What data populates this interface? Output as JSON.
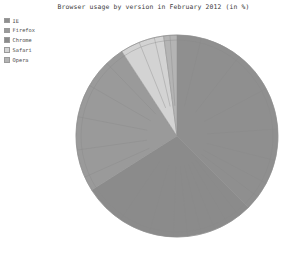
{
  "chart_data": {
    "type": "pie",
    "title": "Browser usage by version in February 2012 (in %)",
    "xlabel": "",
    "ylabel": "",
    "legend_position": "top-left",
    "grid": false,
    "start_angle_deg": 90,
    "direction": "clockwise",
    "categories": [
      "IE",
      "Firefox",
      "Chrome",
      "Safari",
      "Opera"
    ],
    "values": [
      37.5,
      24.8,
      28.5,
      7.1,
      2.1
    ],
    "colors": [
      "#8f8f8f",
      "#9a9a9a",
      "#8b8b8b",
      "#d3d3d3",
      "#b4b4b4"
    ],
    "series": [
      {
        "name": "Browser usage",
        "values": [
          37.5,
          24.8,
          28.5,
          7.1,
          2.1
        ]
      }
    ],
    "slices": [
      {
        "label": "IE",
        "value": 37.5,
        "color": "#8f8f8f",
        "start_deg": 0,
        "end_deg": 135,
        "version_divisions": [
          14,
          38,
          62,
          86,
          104,
          118,
          127
        ]
      },
      {
        "label": "Chrome",
        "value": 28.5,
        "color": "#8b8b8b",
        "start_deg": 135,
        "end_deg": 237.6,
        "version_divisions": [
          142,
          150,
          158,
          166,
          174,
          182,
          196,
          214
        ]
      },
      {
        "label": "Firefox",
        "value": 24.8,
        "color": "#9a9a9a",
        "start_deg": 237.6,
        "end_deg": 326.9,
        "version_divisions": [
          246,
          262,
          281,
          300,
          316
        ]
      },
      {
        "label": "Safari",
        "value": 7.1,
        "color": "#d3d3d3",
        "start_deg": 326.9,
        "end_deg": 352.4,
        "version_divisions": [
          338,
          347
        ]
      },
      {
        "label": "Opera",
        "value": 2.1,
        "color": "#b4b4b4",
        "start_deg": 352.4,
        "end_deg": 360,
        "version_divisions": [
          356
        ]
      }
    ]
  },
  "legend": {
    "items": [
      {
        "label": "IE",
        "color": "#8f8f8f"
      },
      {
        "label": "Firefox",
        "color": "#9a9a9a"
      },
      {
        "label": "Chrome",
        "color": "#8b8b8b"
      },
      {
        "label": "Safari",
        "color": "#d3d3d3"
      },
      {
        "label": "Opera",
        "color": "#b4b4b4"
      }
    ]
  },
  "geometry": {
    "center_x": 177,
    "center_y": 136,
    "radius": 101
  }
}
